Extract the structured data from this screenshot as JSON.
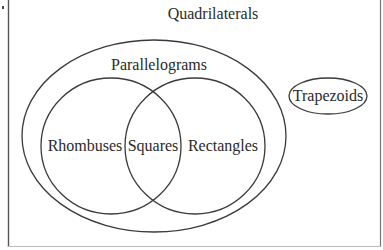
{
  "diagram": {
    "type": "venn",
    "title": "Quadrilaterals",
    "sets": {
      "quadrilaterals": "Quadrilaterals",
      "parallelograms": "Parallelograms",
      "rhombuses": "Rhombuses",
      "squares": "Squares",
      "rectangles": "Rectangles",
      "trapezoids": "Trapezoids"
    },
    "relations": [
      {
        "subset": "Parallelograms",
        "of": "Quadrilaterals"
      },
      {
        "subset": "Trapezoids",
        "of": "Quadrilaterals"
      },
      {
        "subset": "Rhombuses",
        "of": "Parallelograms"
      },
      {
        "subset": "Rectangles",
        "of": "Parallelograms"
      },
      {
        "subset": "Squares",
        "of": "Rhombuses ∩ Rectangles"
      }
    ]
  }
}
